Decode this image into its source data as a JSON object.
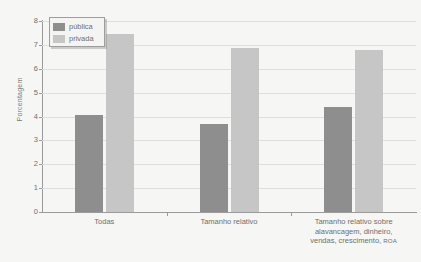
{
  "chart_data": {
    "type": "bar",
    "title": "",
    "xlabel": "",
    "ylabel": "Porcentagem",
    "ylim": [
      0,
      8
    ],
    "ytick_labels": [
      "0",
      "1",
      "2",
      "3",
      "4",
      "5",
      "6",
      "7",
      "8"
    ],
    "ytick_values": [
      0,
      1,
      2,
      3,
      4,
      5,
      6,
      7,
      8
    ],
    "grid": true,
    "legend_position": "top-left",
    "categories": [
      "Todas",
      "Tamanho relativo",
      "Tamanho relativo sobre alavancagem, dinheiro, vendas, crescimento, ROA"
    ],
    "category_lines": [
      [
        "Todas"
      ],
      [
        "Tamanho relativo"
      ],
      [
        "Tamanho relativo sobre",
        "alavancagem, dinheiro,",
        "vendas, crescimento, ROA"
      ]
    ],
    "series": [
      {
        "name": "pública",
        "color": "#8e8e8e",
        "values": [
          4.05,
          3.7,
          4.4
        ]
      },
      {
        "name": "privada",
        "color": "#c6c6c6",
        "values": [
          7.45,
          6.85,
          6.8
        ]
      }
    ]
  },
  "legend": {
    "items": [
      {
        "label": "pública",
        "color": "#8e8e8e"
      },
      {
        "label": "privada",
        "color": "#c6c6c6"
      }
    ]
  },
  "axis": {
    "y_title": "Porcentagem"
  },
  "colors": {
    "background": "#f6f6f4",
    "gridline": "#dedede",
    "axis": "#9a9a9a",
    "text": "#6f6f6f",
    "publica": "#8e8e8e",
    "privada": "#c6c6c6"
  }
}
